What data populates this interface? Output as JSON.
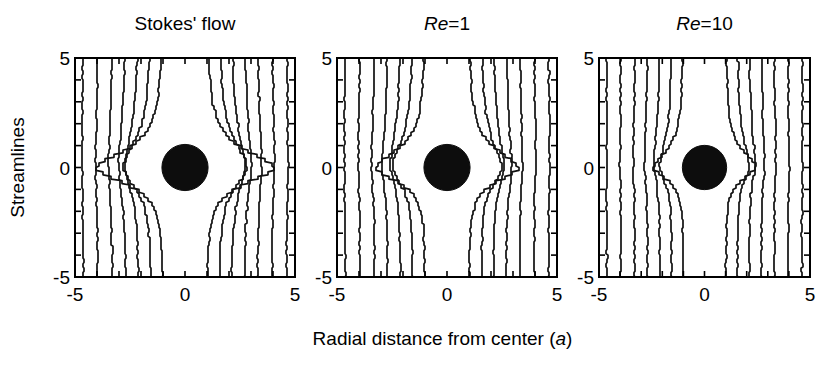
{
  "figure": {
    "width": 835,
    "height": 365,
    "background": "#ffffff",
    "ink_color": "#000000"
  },
  "axis": {
    "xlabel_pre": "Radial distance from center (",
    "xlabel_ital": "a",
    "xlabel_post": ")",
    "ylabel": "Streamlines",
    "xticks": [
      "-5",
      "0",
      "5"
    ],
    "yticks": [
      "5",
      "0",
      "-5"
    ],
    "xlim": [
      -5,
      5
    ],
    "ylim": [
      -5,
      5
    ],
    "minor_tick_count": 10
  },
  "chart_data": {
    "type": "line",
    "title": "",
    "subtitle": "",
    "xlabel": "Radial distance from center (a)",
    "ylabel": "Streamlines",
    "xlim": [
      -5,
      5
    ],
    "ylim": [
      -5,
      5
    ],
    "grid": false,
    "legend_position": "none",
    "obstacle": {
      "shape": "circle",
      "center_x": 0,
      "center_y": 0,
      "radius_a": 1.05,
      "fill": "#0d0d0d"
    },
    "panels": [
      {
        "id": "stokes",
        "title": "Stokes' flow",
        "title_italic": "",
        "reynolds_number": 0,
        "deflection_strength": 1.0,
        "wake_decay": 0.55,
        "streamline_count": 14,
        "streamline_x0": [
          -4.62,
          -3.96,
          -3.3,
          -2.7,
          -2.12,
          -1.56,
          -1.02,
          1.02,
          1.56,
          2.12,
          2.7,
          3.3,
          3.96,
          4.62
        ],
        "xticks": [
          "-5",
          "0",
          "5"
        ],
        "yticks": [
          "5",
          "0",
          "-5"
        ]
      },
      {
        "id": "re1",
        "title": "Re=1",
        "title_italic": "Re",
        "reynolds_number": 1,
        "deflection_strength": 0.74,
        "wake_decay": 0.85,
        "streamline_count": 14,
        "streamline_x0": [
          -4.62,
          -3.96,
          -3.3,
          -2.7,
          -2.12,
          -1.56,
          -1.02,
          1.02,
          1.56,
          2.12,
          2.7,
          3.3,
          3.96,
          4.62
        ],
        "xticks": [
          "-5",
          "0",
          "5"
        ],
        "yticks": [
          "5",
          "0",
          "-5"
        ]
      },
      {
        "id": "re10",
        "title": "Re=10",
        "title_italic": "Re",
        "reynolds_number": 10,
        "deflection_strength": 0.46,
        "wake_decay": 1.35,
        "streamline_count": 14,
        "streamline_x0": [
          -4.62,
          -3.96,
          -3.3,
          -2.7,
          -2.12,
          -1.56,
          -1.02,
          1.02,
          1.56,
          2.12,
          2.7,
          3.3,
          3.96,
          4.62
        ],
        "xticks": [
          "-5",
          "0",
          "5"
        ],
        "yticks": [
          "5",
          "0",
          "-5"
        ]
      }
    ]
  },
  "layout": {
    "panel_boxes": [
      {
        "x": 75,
        "y": 58,
        "w": 220,
        "h": 219
      },
      {
        "x": 337,
        "y": 58,
        "w": 220,
        "h": 219
      },
      {
        "x": 599,
        "y": 58,
        "w": 211,
        "h": 219
      }
    ],
    "title_y": 30,
    "xtick_label_y": 301,
    "xaxis_label_y": 345,
    "yaxis_label_x": 24
  }
}
